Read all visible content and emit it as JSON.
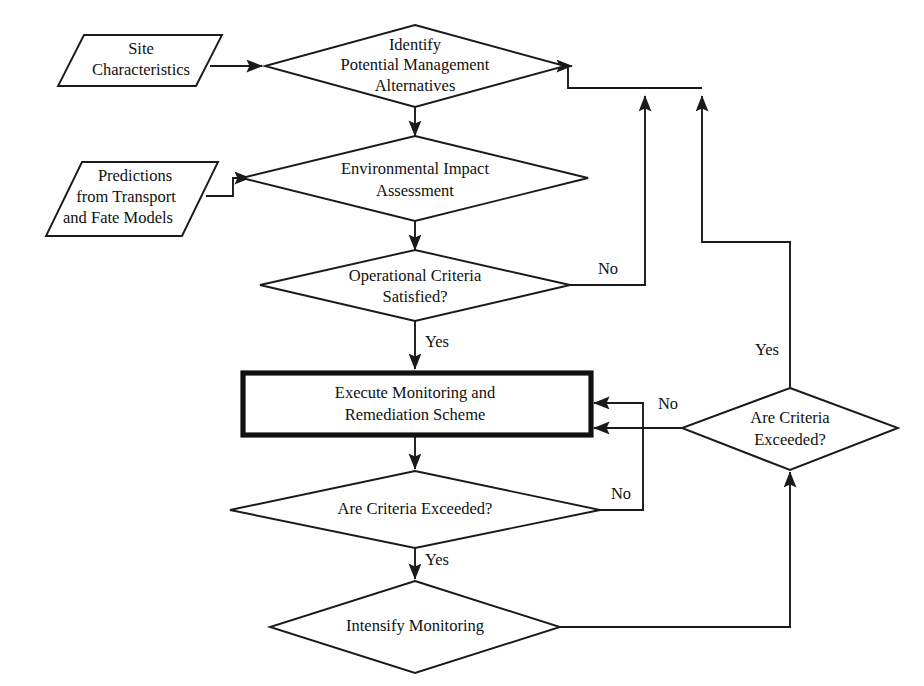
{
  "diagram": {
    "type": "flowchart",
    "background_color": "#fefefe",
    "line_color": "#1a1a1a",
    "text_color": "#111111",
    "nodes": {
      "site_characteristics": {
        "shape": "parallelogram",
        "role": "input",
        "line1": "Site",
        "line2": "Characteristics"
      },
      "identify_alternatives": {
        "shape": "diamond",
        "role": "process",
        "line1": "Identify",
        "line2": "Potential Management",
        "line3": "Alternatives"
      },
      "predictions_models": {
        "shape": "parallelogram",
        "role": "input",
        "line1": "Predictions",
        "line2": "from Transport",
        "line3": "and Fate Models"
      },
      "environmental_impact": {
        "shape": "diamond",
        "role": "process",
        "line1": "Environmental Impact",
        "line2": "Assessment"
      },
      "operational_criteria": {
        "shape": "diamond",
        "role": "decision",
        "line1": "Operational Criteria",
        "line2": "Satisfied?"
      },
      "execute_monitoring": {
        "shape": "rectangle",
        "role": "action",
        "emphasis": "thick-border",
        "line1": "Execute Monitoring and",
        "line2": "Remediation Scheme"
      },
      "criteria_exceeded_lower": {
        "shape": "diamond",
        "role": "decision",
        "line1": "Are Criteria Exceeded?"
      },
      "intensify_monitoring": {
        "shape": "diamond",
        "role": "process",
        "line1": "Intensify Monitoring"
      },
      "criteria_exceeded_right": {
        "shape": "diamond",
        "role": "decision",
        "line1": "Are Criteria",
        "line2": "Exceeded?"
      }
    },
    "edge_labels": {
      "operational_no": "No",
      "operational_yes": "Yes",
      "lower_exceeded_no": "No",
      "lower_exceeded_yes": "Yes",
      "right_exceeded_no": "No",
      "right_exceeded_yes": "Yes"
    }
  }
}
